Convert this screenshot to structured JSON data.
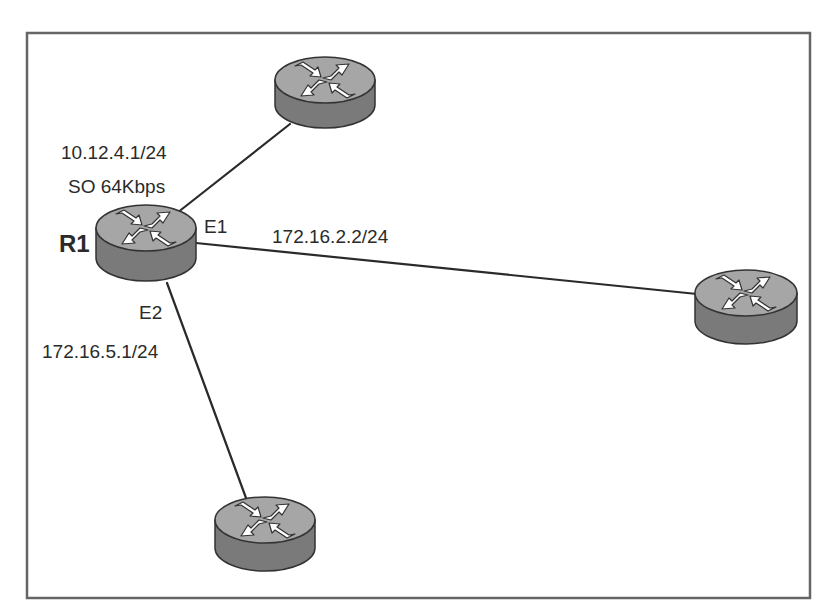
{
  "diagram": {
    "frame": {
      "x": 27,
      "y": 33,
      "width": 783,
      "height": 565,
      "stroke": "#666666"
    },
    "colors": {
      "router_top": "#a6a6a6",
      "router_side": "#7a7a7a",
      "router_outline": "#333333",
      "arrow_fill": "#ffffff",
      "link": "#2a2a2a",
      "text": "#2a2a2a"
    },
    "routers": [
      {
        "id": "r1",
        "name": "R1",
        "cx": 146,
        "cy": 228,
        "rx": 50,
        "ry": 23,
        "h": 30
      },
      {
        "id": "top",
        "name": "",
        "cx": 325,
        "cy": 80,
        "rx": 50,
        "ry": 23,
        "h": 25
      },
      {
        "id": "right",
        "name": "",
        "cx": 746,
        "cy": 293,
        "rx": 51,
        "ry": 23,
        "h": 28
      },
      {
        "id": "bottom",
        "name": "",
        "cx": 265,
        "cy": 520,
        "rx": 50,
        "ry": 23,
        "h": 28
      }
    ],
    "links": [
      {
        "from": "r1",
        "to": "top",
        "x1": 177,
        "y1": 213,
        "x2": 290,
        "y2": 124
      },
      {
        "from": "r1",
        "to": "right",
        "x1": 196,
        "y1": 243,
        "x2": 697,
        "y2": 294
      },
      {
        "from": "r1",
        "to": "bottom",
        "x1": 167,
        "y1": 283,
        "x2": 246,
        "y2": 498
      }
    ],
    "labels": {
      "r1_name": "R1",
      "s0_ip": "10.12.4.1/24",
      "s0_speed": "SO 64Kbps",
      "e1_iface": "E1",
      "e1_ip": "172.16.2.2/24",
      "e2_iface": "E2",
      "e2_ip": "172.16.5.1/24"
    }
  }
}
